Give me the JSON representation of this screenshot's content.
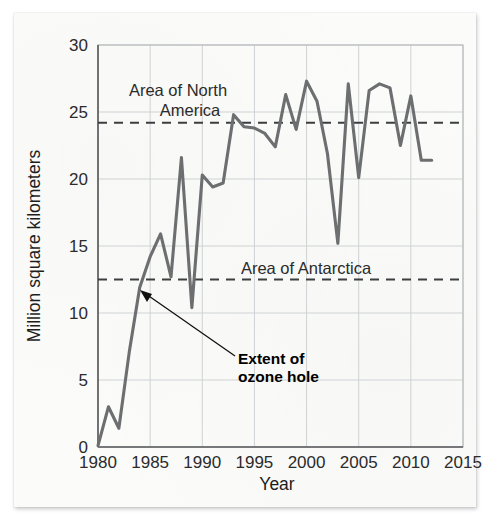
{
  "figure": {
    "background_color": "#fbfbfa",
    "line_color": "#6c6e70",
    "reference_line_color": "#3d3e40"
  },
  "callout": {
    "line1": "Extent of",
    "line2": "ozone hole"
  },
  "chart_data": {
    "type": "line",
    "title": "",
    "xlabel": "Year",
    "ylabel": "Million square kilometers",
    "xlim": [
      1980,
      2015
    ],
    "ylim": [
      0,
      30
    ],
    "xticks": [
      1980,
      1985,
      1990,
      1995,
      2000,
      2005,
      2010,
      2015
    ],
    "xtick_labels": [
      "1980",
      "1985",
      "1990",
      "1995",
      "2000",
      "2005",
      "2010",
      "2015"
    ],
    "yticks": [
      0,
      5,
      10,
      15,
      20,
      25,
      30
    ],
    "ytick_labels": [
      "0",
      "5",
      "10",
      "15",
      "20",
      "25",
      "30"
    ],
    "grid": true,
    "legend": "none",
    "series": [
      {
        "name": "Extent of ozone hole",
        "color": "#6c6e70",
        "x": [
          1980,
          1981,
          1982,
          1983,
          1984,
          1985,
          1986,
          1987,
          1988,
          1989,
          1990,
          1991,
          1992,
          1993,
          1994,
          1995,
          1996,
          1997,
          1998,
          1999,
          2000,
          2001,
          2002,
          2003,
          2004,
          2005,
          2006,
          2007,
          2008,
          2009,
          2010,
          2011,
          2012
        ],
        "values": [
          0.1,
          3.0,
          1.4,
          7.1,
          11.9,
          14.2,
          15.9,
          12.7,
          21.6,
          10.4,
          20.3,
          19.4,
          19.7,
          24.8,
          23.9,
          23.8,
          23.4,
          22.4,
          26.3,
          23.7,
          27.3,
          25.8,
          21.9,
          15.2,
          27.1,
          20.1,
          26.6,
          27.1,
          26.8,
          22.5,
          26.2,
          21.4,
          21.4
        ]
      }
    ],
    "reference_lines": [
      {
        "label": "Area of North America",
        "label_line1": "Area of North",
        "label_line2": "America",
        "value": 24.2,
        "style": "dashed"
      },
      {
        "label": "Area of Antarctica",
        "label_line1": "Area of Antarctica",
        "label_line2": "",
        "value": 12.5,
        "style": "dashed"
      }
    ],
    "annotations": [
      {
        "text": "Extent of ozone hole",
        "target_x": 1984,
        "target_y": 11.9
      }
    ]
  }
}
